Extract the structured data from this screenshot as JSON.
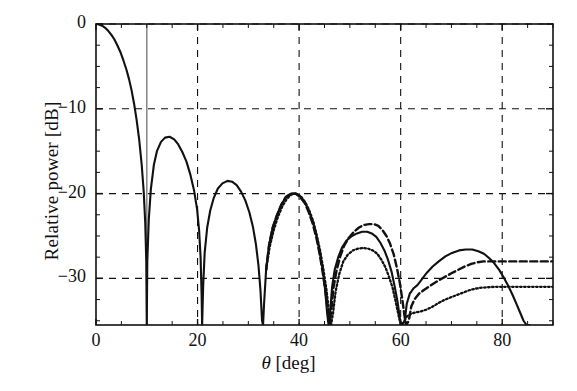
{
  "chart_data": {
    "type": "line",
    "title": "",
    "xlabel": "θ [deg]",
    "ylabel": "Relative power [dB]",
    "xlim": [
      0,
      90
    ],
    "ylim": [
      -35.5,
      0
    ],
    "grid": true,
    "grid_style": "dashed",
    "xticks": [
      0,
      20,
      40,
      60,
      80
    ],
    "xtick_labels": [
      "0",
      "20",
      "40",
      "60",
      "80"
    ],
    "yticks": [
      0,
      -10,
      -20,
      -30
    ],
    "ytick_labels": [
      "0",
      "−10",
      "−20",
      "−30"
    ],
    "legend": null,
    "annotations": [
      {
        "name": "vertical-marker",
        "type": "vline",
        "x": 10,
        "style": "solid",
        "color": "#8a8a8a"
      }
    ],
    "series": [
      {
        "name": "solid",
        "style": "solid",
        "color": "#111111",
        "points": [
          [
            0,
            0
          ],
          [
            0.6,
            -0.05
          ],
          [
            1.2,
            -0.2
          ],
          [
            1.8,
            -0.45
          ],
          [
            2.4,
            -0.8
          ],
          [
            3,
            -1.25
          ],
          [
            3.6,
            -1.8
          ],
          [
            4.2,
            -2.5
          ],
          [
            4.8,
            -3.3
          ],
          [
            5.4,
            -4.3
          ],
          [
            6,
            -5.4
          ],
          [
            6.5,
            -6.5
          ],
          [
            7,
            -7.8
          ],
          [
            7.5,
            -9.4
          ],
          [
            8,
            -11.3
          ],
          [
            8.5,
            -13.6
          ],
          [
            9,
            -16.6
          ],
          [
            9.4,
            -19.8
          ],
          [
            9.7,
            -23.5
          ],
          [
            9.9,
            -28
          ],
          [
            10,
            -40
          ],
          [
            10.1,
            -28
          ],
          [
            10.4,
            -23
          ],
          [
            10.8,
            -19.5
          ],
          [
            11.4,
            -16.6
          ],
          [
            12,
            -15
          ],
          [
            12.8,
            -13.9
          ],
          [
            13.6,
            -13.4
          ],
          [
            14.5,
            -13.3
          ],
          [
            15.4,
            -13.6
          ],
          [
            16.2,
            -14.2
          ],
          [
            17,
            -15.1
          ],
          [
            17.8,
            -16.2
          ],
          [
            18.6,
            -17.8
          ],
          [
            19.3,
            -19.6
          ],
          [
            19.9,
            -21.8
          ],
          [
            20.3,
            -24.3
          ],
          [
            20.6,
            -27.5
          ],
          [
            20.8,
            -32
          ],
          [
            20.9,
            -40
          ],
          [
            21.1,
            -31
          ],
          [
            21.4,
            -27
          ],
          [
            21.9,
            -24
          ],
          [
            22.5,
            -22
          ],
          [
            23.2,
            -20.5
          ],
          [
            24,
            -19.4
          ],
          [
            24.9,
            -18.8
          ],
          [
            25.9,
            -18.5
          ],
          [
            26.8,
            -18.6
          ],
          [
            27.7,
            -19
          ],
          [
            28.6,
            -19.8
          ],
          [
            29.4,
            -20.8
          ],
          [
            30.2,
            -22.2
          ],
          [
            30.9,
            -23.9
          ],
          [
            31.5,
            -26
          ],
          [
            32,
            -28.5
          ],
          [
            32.4,
            -31.5
          ],
          [
            32.7,
            -35
          ],
          [
            32.9,
            -40
          ],
          [
            33.1,
            -33
          ],
          [
            33.5,
            -29
          ],
          [
            34.1,
            -26
          ],
          [
            34.8,
            -24
          ],
          [
            35.6,
            -22.6
          ],
          [
            36.5,
            -21.3
          ],
          [
            37.4,
            -20.4
          ],
          [
            38.4,
            -20.0
          ],
          [
            39.3,
            -20.0
          ],
          [
            40.2,
            -20.3
          ],
          [
            41.1,
            -21
          ],
          [
            41.9,
            -22
          ],
          [
            42.7,
            -23.3
          ],
          [
            43.4,
            -24.9
          ],
          [
            44,
            -26.7
          ],
          [
            44.6,
            -28.8
          ],
          [
            45.1,
            -31.2
          ],
          [
            45.5,
            -34
          ],
          [
            45.8,
            -40
          ],
          [
            46.1,
            -34
          ],
          [
            46.5,
            -31
          ],
          [
            47,
            -29
          ],
          [
            47.7,
            -27.5
          ],
          [
            48.5,
            -26.3
          ],
          [
            49.4,
            -25.5
          ],
          [
            50.4,
            -25
          ],
          [
            51.4,
            -24.7
          ],
          [
            52.4,
            -24.5
          ],
          [
            53.4,
            -24.5
          ],
          [
            54.3,
            -24.7
          ],
          [
            55.2,
            -25.1
          ],
          [
            56,
            -25.8
          ],
          [
            56.8,
            -26.7
          ],
          [
            57.5,
            -27.8
          ],
          [
            58.2,
            -29.2
          ],
          [
            58.8,
            -30.9
          ],
          [
            59.4,
            -32.8
          ],
          [
            59.9,
            -35
          ],
          [
            60.3,
            -40
          ],
          [
            60.8,
            -35
          ],
          [
            61.2,
            -33
          ],
          [
            61.8,
            -31.8
          ],
          [
            62.5,
            -31.2
          ],
          [
            63.3,
            -30.8
          ],
          [
            64.2,
            -30.1
          ],
          [
            65.2,
            -29.3
          ],
          [
            66.3,
            -28.6
          ],
          [
            67.5,
            -28
          ],
          [
            68.8,
            -27.4
          ],
          [
            70.1,
            -27
          ],
          [
            71.5,
            -26.7
          ],
          [
            72.8,
            -26.6
          ],
          [
            74.1,
            -26.6
          ],
          [
            75.3,
            -26.8
          ],
          [
            76.4,
            -27.1
          ],
          [
            77.4,
            -27.6
          ],
          [
            78.4,
            -28.2
          ],
          [
            79.4,
            -29
          ],
          [
            80.3,
            -29.9
          ],
          [
            81.2,
            -30.9
          ],
          [
            82,
            -31.9
          ],
          [
            82.8,
            -33
          ],
          [
            83.5,
            -34
          ],
          [
            84.2,
            -35
          ],
          [
            84.8,
            -35.5
          ],
          [
            85.4,
            -35.5
          ]
        ]
      },
      {
        "name": "dashed",
        "style": "dashed",
        "color": "#111111",
        "points": [
          [
            33.5,
            -29
          ],
          [
            34.1,
            -26
          ],
          [
            34.8,
            -24
          ],
          [
            35.6,
            -22.6
          ],
          [
            36.5,
            -21.3
          ],
          [
            37.4,
            -20.4
          ],
          [
            38.4,
            -20.0
          ],
          [
            39.3,
            -20.0
          ],
          [
            40.2,
            -20.4
          ],
          [
            41.1,
            -21.1
          ],
          [
            41.9,
            -22.2
          ],
          [
            42.7,
            -23.6
          ],
          [
            43.4,
            -25.2
          ],
          [
            44,
            -27
          ],
          [
            44.6,
            -29.1
          ],
          [
            45.2,
            -31.6
          ],
          [
            45.7,
            -34
          ],
          [
            46,
            -40
          ],
          [
            46.3,
            -34
          ],
          [
            46.8,
            -31
          ],
          [
            47.4,
            -29
          ],
          [
            48.1,
            -27.4
          ],
          [
            48.9,
            -26.1
          ],
          [
            49.8,
            -25.2
          ],
          [
            50.8,
            -24.5
          ],
          [
            51.8,
            -24
          ],
          [
            52.8,
            -23.7
          ],
          [
            53.8,
            -23.6
          ],
          [
            54.7,
            -23.6
          ],
          [
            55.6,
            -23.8
          ],
          [
            56.4,
            -24.3
          ],
          [
            57.2,
            -25
          ],
          [
            57.9,
            -25.9
          ],
          [
            58.6,
            -27.1
          ],
          [
            59.2,
            -28.6
          ],
          [
            59.8,
            -30.4
          ],
          [
            60.3,
            -32.4
          ],
          [
            60.8,
            -34.6
          ],
          [
            61.1,
            -40
          ],
          [
            61.6,
            -35
          ],
          [
            62.1,
            -33.3
          ],
          [
            62.8,
            -32.4
          ],
          [
            63.6,
            -31.8
          ],
          [
            64.5,
            -31.4
          ],
          [
            65.5,
            -31
          ],
          [
            66.5,
            -30.6
          ],
          [
            67.6,
            -30.2
          ],
          [
            68.8,
            -29.8
          ],
          [
            70,
            -29.4
          ],
          [
            71.3,
            -29
          ],
          [
            72.6,
            -28.6
          ],
          [
            73.9,
            -28.3
          ],
          [
            75.1,
            -28.1
          ],
          [
            76.3,
            -28
          ],
          [
            77.5,
            -28
          ],
          [
            78.7,
            -28
          ],
          [
            80,
            -28
          ],
          [
            81.5,
            -28
          ],
          [
            83,
            -28
          ],
          [
            84.5,
            -28
          ],
          [
            86,
            -28
          ],
          [
            87.5,
            -28
          ],
          [
            89,
            -28
          ],
          [
            90,
            -28
          ]
        ]
      },
      {
        "name": "dotted",
        "style": "dotted",
        "color": "#111111",
        "points": [
          [
            33.5,
            -29
          ],
          [
            34.2,
            -26.3
          ],
          [
            35,
            -24.3
          ],
          [
            35.8,
            -22.8
          ],
          [
            36.7,
            -21.5
          ],
          [
            37.6,
            -20.6
          ],
          [
            38.5,
            -20.1
          ],
          [
            39.4,
            -20.0
          ],
          [
            40.3,
            -20.3
          ],
          [
            41.2,
            -21
          ],
          [
            42,
            -22
          ],
          [
            42.8,
            -23.3
          ],
          [
            43.5,
            -25
          ],
          [
            44.2,
            -26.9
          ],
          [
            44.8,
            -29
          ],
          [
            45.4,
            -31.4
          ],
          [
            45.9,
            -34
          ],
          [
            46.3,
            -40
          ],
          [
            46.7,
            -34
          ],
          [
            47.2,
            -31.5
          ],
          [
            47.9,
            -29.5
          ],
          [
            48.7,
            -28
          ],
          [
            49.6,
            -27.2
          ],
          [
            50.6,
            -26.7
          ],
          [
            51.6,
            -26.5
          ],
          [
            52.6,
            -26.4
          ],
          [
            53.6,
            -26.5
          ],
          [
            54.5,
            -26.7
          ],
          [
            55.4,
            -27.1
          ],
          [
            56.2,
            -27.8
          ],
          [
            57,
            -28.7
          ],
          [
            57.7,
            -29.8
          ],
          [
            58.4,
            -31.1
          ],
          [
            59,
            -32.7
          ],
          [
            59.6,
            -34.4
          ],
          [
            60,
            -40
          ],
          [
            60.6,
            -35.2
          ],
          [
            61.2,
            -34.5
          ],
          [
            62,
            -34.2
          ],
          [
            63,
            -34
          ],
          [
            64,
            -33.9
          ],
          [
            65,
            -33.7
          ],
          [
            66.1,
            -33.4
          ],
          [
            67.2,
            -33
          ],
          [
            68.4,
            -32.6
          ],
          [
            69.6,
            -32.3
          ],
          [
            70.9,
            -32
          ],
          [
            72.2,
            -31.7
          ],
          [
            73.5,
            -31.4
          ],
          [
            74.8,
            -31.2
          ],
          [
            76,
            -31.1
          ],
          [
            77.2,
            -31.05
          ],
          [
            78.5,
            -31
          ],
          [
            80,
            -31
          ],
          [
            81.5,
            -31
          ],
          [
            83,
            -31
          ],
          [
            84.5,
            -31
          ],
          [
            86,
            -31
          ],
          [
            87.5,
            -31
          ],
          [
            89,
            -31
          ],
          [
            90,
            -31
          ]
        ]
      }
    ]
  },
  "axis": {
    "ylabel": "Relative power [dB]",
    "xlabel_theta": "θ",
    "xlabel_unit": " [deg]",
    "ytick_labels": [
      "0",
      "−10",
      "−20",
      "−30"
    ],
    "xtick_labels": [
      "0",
      "20",
      "40",
      "60",
      "80"
    ]
  }
}
